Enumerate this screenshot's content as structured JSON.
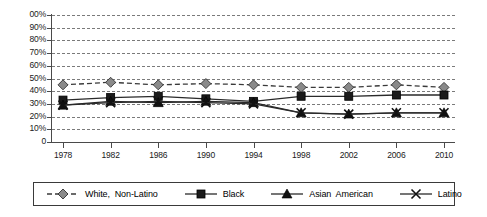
{
  "chart_data": {
    "type": "line",
    "title": "",
    "xlabel": "",
    "ylabel": "",
    "categories": [
      "1978",
      "1982",
      "1986",
      "1990",
      "1994",
      "1998",
      "2002",
      "2006",
      "2010"
    ],
    "x": [
      1978,
      1982,
      1986,
      1990,
      1994,
      1998,
      2002,
      2006,
      2010
    ],
    "ylim": [
      0,
      100
    ],
    "ytick_labels": [
      "00%",
      "90%",
      "80%",
      "70%",
      "60%",
      "50%",
      "40%",
      "30%",
      "20%",
      "10%",
      "0"
    ],
    "ytick_values": [
      100,
      90,
      80,
      70,
      60,
      50,
      40,
      30,
      20,
      10,
      0
    ],
    "grid": true,
    "legend_position": "bottom",
    "series": [
      {
        "name": "White, Non-Latino",
        "marker": "diamond",
        "line_style": "dashed",
        "color": "#8a8a8a",
        "line_color": "#3a3a3a",
        "values": [
          45,
          47,
          45,
          46,
          45,
          43,
          43,
          45,
          43
        ]
      },
      {
        "name": "Black",
        "marker": "square",
        "line_style": "solid",
        "color": "#1a1a1a",
        "line_color": "#2a2a2a",
        "values": [
          33,
          35,
          36,
          34,
          32,
          36,
          36,
          37,
          37
        ]
      },
      {
        "name": "Asian American",
        "marker": "triangle",
        "line_style": "solid",
        "color": "#111111",
        "line_color": "#2a2a2a",
        "values": [
          29,
          32,
          31,
          32,
          31,
          23,
          22,
          23,
          23
        ]
      },
      {
        "name": "Latino",
        "marker": "x",
        "line_style": "solid",
        "color": "#111111",
        "line_color": "#2a2a2a",
        "values": [
          29,
          31,
          32,
          31,
          30,
          23,
          22,
          23,
          23
        ]
      }
    ]
  },
  "legend": {
    "items": [
      {
        "label": "White,  Non-Latino",
        "marker": "diamond-icon"
      },
      {
        "label": "Black",
        "marker": "square-icon"
      },
      {
        "label": "Asian  American",
        "marker": "triangle-icon"
      },
      {
        "label": "Latino",
        "marker": "x-icon"
      }
    ]
  }
}
